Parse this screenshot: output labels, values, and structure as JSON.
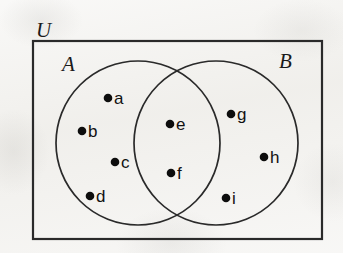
{
  "figure": {
    "type": "venn-diagram",
    "universe_label": "U",
    "set_a_label": "A",
    "set_b_label": "B",
    "background_color": "#f2f1ee",
    "ink_color": "#1a1a1a"
  },
  "sets": {
    "A": [
      "a",
      "b",
      "c",
      "d",
      "e",
      "f"
    ],
    "B": [
      "e",
      "f",
      "g",
      "h",
      "i"
    ],
    "A_only": [
      "a",
      "b",
      "c",
      "d"
    ],
    "intersection": [
      "e",
      "f"
    ],
    "B_only": [
      "g",
      "h",
      "i"
    ],
    "universe": [
      "a",
      "b",
      "c",
      "d",
      "e",
      "f",
      "g",
      "h",
      "i"
    ]
  },
  "elements": [
    {
      "label": "a",
      "region": "A-only",
      "dot_x": 108,
      "dot_y": 98,
      "text_x": 114,
      "text_y": 104
    },
    {
      "label": "b",
      "region": "A-only",
      "dot_x": 82,
      "dot_y": 131,
      "text_x": 88,
      "text_y": 137
    },
    {
      "label": "c",
      "region": "A-only",
      "dot_x": 115,
      "dot_y": 162,
      "text_x": 121,
      "text_y": 168
    },
    {
      "label": "d",
      "region": "A-only",
      "dot_x": 90,
      "dot_y": 196,
      "text_x": 96,
      "text_y": 202
    },
    {
      "label": "e",
      "region": "intersection",
      "dot_x": 170,
      "dot_y": 124,
      "text_x": 176,
      "text_y": 130
    },
    {
      "label": "f",
      "region": "intersection",
      "dot_x": 171,
      "dot_y": 173,
      "text_x": 177,
      "text_y": 179
    },
    {
      "label": "g",
      "region": "B-only",
      "dot_x": 231,
      "dot_y": 114,
      "text_x": 237,
      "text_y": 120
    },
    {
      "label": "h",
      "region": "B-only",
      "dot_x": 264,
      "dot_y": 157,
      "text_x": 270,
      "text_y": 163
    },
    {
      "label": "i",
      "region": "B-only",
      "dot_x": 226,
      "dot_y": 198,
      "text_x": 232,
      "text_y": 204
    }
  ],
  "geometry": {
    "universe_rect": {
      "x": 33,
      "y": 41,
      "width": 289,
      "height": 198
    },
    "circle_a": {
      "cx": 138,
      "cy": 143,
      "r": 82
    },
    "circle_b": {
      "cx": 216,
      "cy": 143,
      "r": 82
    },
    "universe_label_pos": {
      "x": 36,
      "y": 37
    },
    "set_a_label_pos": {
      "x": 62,
      "y": 71
    },
    "set_b_label_pos": {
      "x": 279,
      "y": 68
    },
    "dot_radius": 4.3
  }
}
